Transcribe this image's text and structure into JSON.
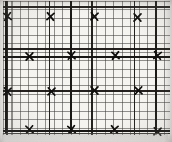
{
  "document": {
    "kind": "scanned-graph-paper",
    "title": "Graph paper with plotted X marks",
    "background_color": "#f6f4f1",
    "ink_color": "#141210",
    "minor_grid_color": "#3c3a38",
    "major_grid_color": "#181614"
  },
  "chart_data": {
    "type": "scatter",
    "title": "",
    "xlabel": "",
    "ylabel": "",
    "grid": true,
    "legend": null,
    "marker": "x",
    "grid_minor_pitch_px": 8.5,
    "grid_major_every": 5,
    "xlim": [
      3,
      170
    ],
    "ylim": [
      1,
      134
    ],
    "axis_lines": {
      "vertical_px": [
        6,
        71,
        156
      ],
      "horizontal_px": [
        57,
        131
      ]
    },
    "points_px": [
      {
        "x": 7,
        "y": 16
      },
      {
        "x": 50,
        "y": 16
      },
      {
        "x": 94,
        "y": 16
      },
      {
        "x": 137,
        "y": 17
      },
      {
        "x": 29,
        "y": 56
      },
      {
        "x": 71,
        "y": 55
      },
      {
        "x": 115,
        "y": 55
      },
      {
        "x": 157,
        "y": 55
      },
      {
        "x": 7,
        "y": 91
      },
      {
        "x": 51,
        "y": 91
      },
      {
        "x": 94,
        "y": 90
      },
      {
        "x": 138,
        "y": 90
      },
      {
        "x": 29,
        "y": 129
      },
      {
        "x": 71,
        "y": 129
      },
      {
        "x": 114,
        "y": 129
      },
      {
        "x": 157,
        "y": 131
      }
    ],
    "rows": [
      {
        "label": "row-1",
        "count": 4
      },
      {
        "label": "row-2",
        "count": 4
      },
      {
        "label": "row-3",
        "count": 4
      },
      {
        "label": "row-4",
        "count": 4
      }
    ],
    "total_marks": 16
  }
}
